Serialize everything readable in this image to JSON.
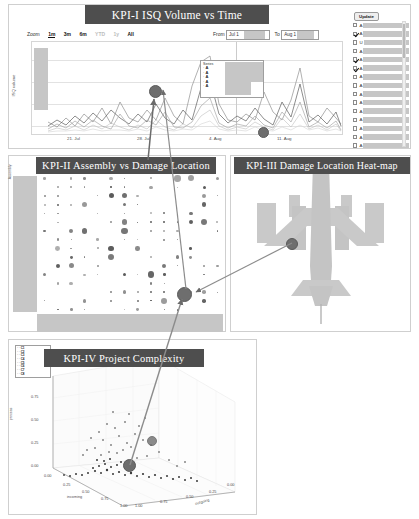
{
  "dashboard": {
    "title": "KPI Dashboard"
  },
  "kpi1": {
    "title": "KPI-I ISQ Volume vs Time",
    "zoom_label": "Zoom",
    "zoom_options": [
      "1m",
      "3m",
      "6m",
      "YTD",
      "1y",
      "All"
    ],
    "zoom_selected": "1m",
    "zoom_disabled": [
      "YTD",
      "1y"
    ],
    "from_label": "From",
    "to_label": "To",
    "from_value": "Jul 1",
    "to_value": "Aug 1",
    "y_axis_label": "ISQ volume",
    "x_ticks": [
      "21. Jul",
      "28. Jul",
      "4. Aug",
      "11. Aug"
    ],
    "legend": {
      "header": "Series",
      "items": [
        "A",
        "A",
        "A",
        "A",
        "A"
      ]
    },
    "update_button": "Update",
    "checkbox_list": [
      {
        "label": "A",
        "checked": false
      },
      {
        "label": "A",
        "checked": true
      },
      {
        "label": "U",
        "checked": false
      },
      {
        "label": "A",
        "checked": false
      },
      {
        "label": "A",
        "checked": true
      },
      {
        "label": "A",
        "checked": true
      },
      {
        "label": "A",
        "checked": false
      },
      {
        "label": "A",
        "checked": false
      },
      {
        "label": "A",
        "checked": false
      },
      {
        "label": "A",
        "checked": false
      },
      {
        "label": "A",
        "checked": false
      },
      {
        "label": "A",
        "checked": false
      },
      {
        "label": "A",
        "checked": false
      },
      {
        "label": "A",
        "checked": false
      },
      {
        "label": "A",
        "checked": false
      }
    ]
  },
  "kpi2": {
    "title": "KPI-II Assembly vs Damage Location",
    "y_axis_label": "Assembly",
    "x_axis_label": "Damage Location"
  },
  "kpi3": {
    "title": "KPI-III Damage Location Heat-map",
    "graphic": "aircraft-top-view"
  },
  "kpi4": {
    "title": "KPI-IV Project Complexity",
    "z_axis_label": "process",
    "x_axis_label": "incoming",
    "y_axis_label": "outgoing",
    "ticks": [
      "0.00",
      "0.25",
      "0.50",
      "0.75",
      "1.00"
    ],
    "legend_items": [
      "C1",
      "C2",
      "C3",
      "C4",
      "C5",
      "C6",
      "C7",
      "C8"
    ]
  },
  "chart_data": [
    {
      "type": "line",
      "id": "kpi1",
      "title": "KPI-I ISQ Volume vs Time",
      "xlabel": "",
      "ylabel": "ISQ volume",
      "x_ticks": [
        "21. Jul",
        "28. Jul",
        "4. Aug",
        "11. Aug"
      ],
      "grid": true,
      "legend_position": "inside-right",
      "series": [
        {
          "name": "A",
          "values": [
            8,
            5,
            12,
            6,
            14,
            9,
            18,
            7,
            22,
            11,
            9,
            16,
            10,
            24,
            12,
            8,
            30,
            52,
            58,
            20,
            11,
            9,
            14,
            10,
            26,
            13,
            9,
            21,
            44,
            12,
            9,
            17,
            11,
            8
          ]
        },
        {
          "name": "A",
          "values": [
            5,
            9,
            6,
            11,
            7,
            13,
            8,
            15,
            9,
            7,
            12,
            8,
            18,
            10,
            7,
            14,
            9,
            26,
            31,
            13,
            8,
            12,
            9,
            16,
            10,
            7,
            19,
            11,
            28,
            9,
            13,
            8,
            15,
            6
          ]
        },
        {
          "name": "A",
          "values": [
            3,
            6,
            4,
            8,
            5,
            9,
            6,
            4,
            11,
            6,
            5,
            9,
            7,
            12,
            6,
            5,
            8,
            14,
            17,
            8,
            5,
            7,
            6,
            10,
            7,
            5,
            11,
            8,
            15,
            6,
            8,
            5,
            9,
            4
          ]
        },
        {
          "name": "A",
          "values": [
            2,
            4,
            3,
            5,
            3,
            6,
            4,
            7,
            5,
            3,
            6,
            4,
            8,
            5,
            3,
            7,
            5,
            9,
            11,
            6,
            3,
            5,
            4,
            7,
            5,
            3,
            8,
            5,
            10,
            4,
            6,
            3,
            7,
            3
          ]
        },
        {
          "name": "A",
          "values": [
            1,
            2,
            2,
            3,
            2,
            4,
            2,
            3,
            3,
            2,
            4,
            2,
            5,
            3,
            2,
            4,
            3,
            6,
            7,
            4,
            2,
            3,
            2,
            5,
            3,
            2,
            5,
            3,
            6,
            3,
            4,
            2,
            4,
            2
          ]
        }
      ],
      "markers": [
        {
          "x_index": 18,
          "label": "selected-peak"
        },
        {
          "x_index": 28,
          "label": "selected-point"
        }
      ]
    },
    {
      "type": "scatter",
      "id": "kpi2",
      "title": "KPI-II Assembly vs Damage Location",
      "xlabel": "Damage Location",
      "ylabel": "Assembly",
      "note": "bubble matrix, size encodes count; axis tick labels redacted"
    },
    {
      "type": "heatmap",
      "id": "kpi3",
      "title": "KPI-III Damage Location Heat-map",
      "note": "aircraft planform silhouette with damage-location marker on left wing"
    },
    {
      "type": "scatter",
      "id": "kpi4",
      "title": "KPI-IV Project Complexity",
      "xlabel": "incoming",
      "ylabel": "outgoing",
      "zlabel": "process",
      "xlim": [
        0.0,
        1.0
      ],
      "ylim": [
        0.0,
        1.0
      ],
      "zlim": [
        0.0,
        1.0
      ],
      "ticks": [
        "0.00",
        "0.25",
        "0.50",
        "0.75",
        "1.00"
      ],
      "note": "3D scatter of project complexity; dense cluster near origin"
    }
  ]
}
